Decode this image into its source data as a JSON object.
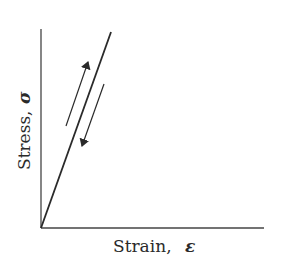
{
  "diagram": {
    "type": "stress-strain linear elastic loading/unloading",
    "x_axis_label": "Strain,",
    "x_axis_symbol": "ε",
    "y_axis_label": "Stress,",
    "y_axis_symbol": "σ",
    "line_color": "#2a2a2a",
    "elements": [
      {
        "name": "elastic-line",
        "description": "straight line from origin, steep slope"
      },
      {
        "name": "loading-arrow",
        "direction": "up"
      },
      {
        "name": "unloading-arrow",
        "direction": "down"
      }
    ]
  }
}
